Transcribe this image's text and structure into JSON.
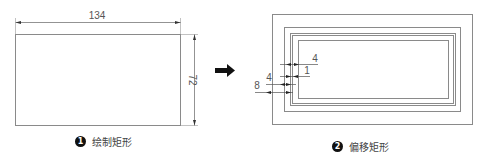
{
  "figure1": {
    "caption_number": "1",
    "caption_text": "绘制矩形",
    "rectangle": {
      "width": 134,
      "height": 72
    },
    "dimension_width_label": "134",
    "dimension_height_label": "72"
  },
  "arrow": {
    "direction": "right",
    "color": "#111111"
  },
  "figure2": {
    "caption_number": "2",
    "caption_text": "偏移矩形",
    "offset_labels": [
      "4",
      "1",
      "4",
      "8"
    ],
    "offsets_description": "Rectangle offset outward by 4, 1, 4, 8"
  },
  "colors": {
    "line": "#8a8a8a",
    "dim_line": "#555555",
    "text": "#444444",
    "badge": "#111111"
  }
}
